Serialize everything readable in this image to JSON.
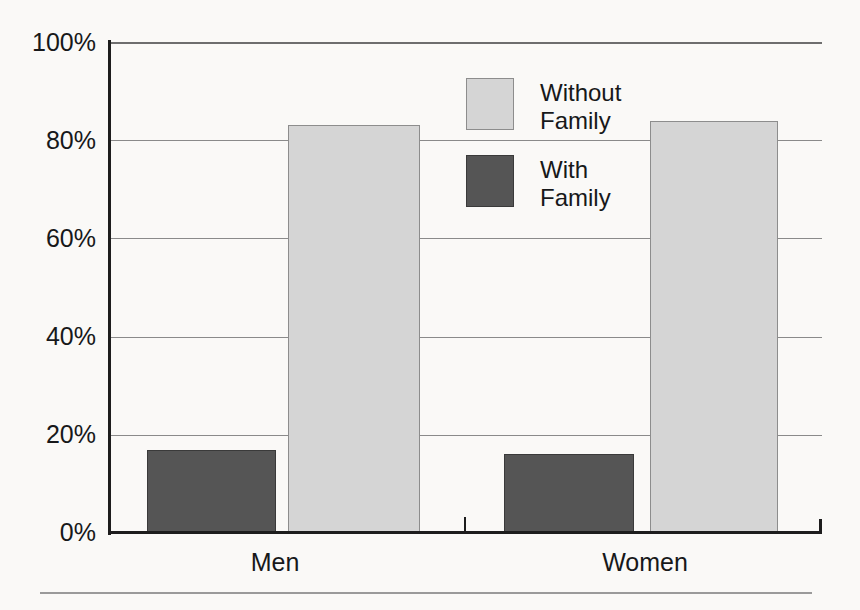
{
  "chart_data": {
    "type": "bar",
    "title": "",
    "subtitle": "",
    "xlabel": "",
    "ylabel": "",
    "categories": [
      "Men",
      "Women"
    ],
    "series": [
      {
        "name": "Without Family",
        "values": [
          83,
          84
        ],
        "color": "#d5d5d5"
      },
      {
        "name": "With Family",
        "values": [
          17,
          16
        ],
        "color": "#555555"
      }
    ],
    "ylim": [
      0,
      100
    ],
    "ytick_values": [
      0,
      20,
      40,
      60,
      80,
      100
    ],
    "ytick_labels": [
      "0%",
      "20%",
      "40%",
      "60%",
      "80%",
      "100%"
    ],
    "xtick_labels": [
      "Men",
      "Women"
    ],
    "grid": true,
    "grid_axis": "y",
    "legend": true,
    "legend_position": "upper center",
    "legend_entries": [
      {
        "label": "Without\nFamily",
        "color": "#d5d5d5"
      },
      {
        "label": "With\nFamily",
        "color": "#555555"
      }
    ],
    "value_labels_shown": false,
    "bars": [
      {
        "category": "Men",
        "series": "With Family",
        "value": 17
      },
      {
        "category": "Men",
        "series": "Without Family",
        "value": 83
      },
      {
        "category": "Women",
        "series": "With Family",
        "value": 16
      },
      {
        "category": "Women",
        "series": "Without Family",
        "value": 84
      }
    ]
  },
  "axis": {
    "y_labels": [
      "100%",
      "80%",
      "60%",
      "40%",
      "20%",
      "0%"
    ],
    "x_labels": [
      "Men",
      "Women"
    ]
  },
  "legend": {
    "items": [
      {
        "label": "Without\nFamily"
      },
      {
        "label": "With\nFamily"
      }
    ]
  },
  "colors": {
    "light_bar": "#d5d5d5",
    "dark_bar": "#555555",
    "axis": "#1d1d1d",
    "gridline": "#8a8a8a",
    "background": "#faf9f7",
    "text": "#17181a"
  }
}
